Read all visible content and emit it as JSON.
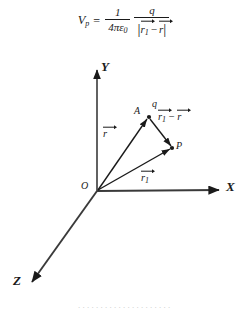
{
  "formula": {
    "lhs_variable": "V",
    "lhs_subscript": "p",
    "equals": "=",
    "first_fraction": {
      "numerator": "1",
      "denominator_prefix": "4",
      "denominator_pi": "π",
      "denominator_eps": "ε",
      "denominator_eps_subscript": "0"
    },
    "second_fraction": {
      "numerator": "q",
      "denominator_abs_open": "|",
      "denominator_vec1": "r",
      "denominator_vec1_subscript": "1",
      "denominator_minus": "−",
      "denominator_vec2": "r",
      "denominator_abs_close": "|"
    },
    "plain_text": "V_p = 1/(4πε₀) · q/|r⃗₁ − r⃗|"
  },
  "diagram": {
    "axes": [
      {
        "name": "y-axis",
        "label": "Y",
        "label_x": 101,
        "label_y": 7,
        "from": [
          97,
          136
        ],
        "to": [
          97,
          14
        ]
      },
      {
        "name": "x-axis",
        "label": "X",
        "label_x": 227,
        "label_y": 127,
        "from": [
          97,
          136
        ],
        "to": [
          221,
          135
        ]
      },
      {
        "name": "z-axis",
        "label": "Z",
        "label_x": 14,
        "label_y": 222,
        "from": [
          97,
          136
        ],
        "to": [
          31,
          228
        ]
      }
    ],
    "points": [
      {
        "name": "origin",
        "label": "O",
        "label_x": 82,
        "label_y": 128,
        "x": 97,
        "y": 136
      },
      {
        "name": "charge-point-a",
        "label": "A",
        "label_x": 134,
        "label_y": 54,
        "x": 149,
        "y": 62
      },
      {
        "name": "charge-label",
        "label": "q",
        "label_x": 152,
        "label_y": 49,
        "x": 149,
        "y": 62
      },
      {
        "name": "field-point-p",
        "label": "P",
        "label_x": 176,
        "label_y": 88,
        "x": 172,
        "y": 93
      }
    ],
    "vectors": [
      {
        "name": "vector-r",
        "letter": "r",
        "subscript": "",
        "label_x": 104,
        "label_y": 74,
        "from": [
          97,
          136
        ],
        "to": [
          149,
          62
        ]
      },
      {
        "name": "vector-r1",
        "letter": "r",
        "subscript": "1",
        "label_x": 142,
        "label_y": 118,
        "from": [
          97,
          136
        ],
        "to": [
          172,
          93
        ]
      },
      {
        "name": "vector-r1-minus-r",
        "letter": "r",
        "subscript": "1",
        "letter2": "r",
        "minus": "−",
        "label_x": 160,
        "label_y": 56,
        "from": [
          149,
          62
        ],
        "to": [
          172,
          93
        ]
      }
    ],
    "colors": {
      "stroke": "#1a1a1a",
      "background": "#ffffff"
    }
  },
  "bottom_caption": ". . . . . . . . . . . . . . . . . . . . ."
}
